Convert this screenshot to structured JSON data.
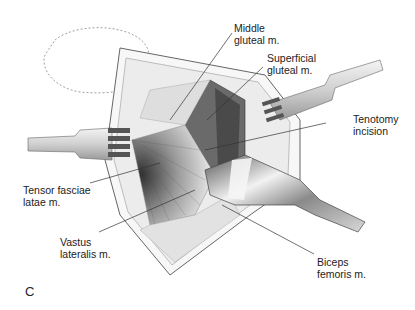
{
  "figure": {
    "panel_letter": "C",
    "labels": [
      {
        "id": "middle-gluteal",
        "lines": [
          "Middle",
          "gluteal m."
        ]
      },
      {
        "id": "superficial-gluteal",
        "lines": [
          "Superficial",
          "gluteal m."
        ]
      },
      {
        "id": "tenotomy-incision",
        "lines": [
          "Tenotomy",
          "incision"
        ]
      },
      {
        "id": "tensor-fasciae-latae",
        "lines": [
          "Tensor fasciae",
          "latae m."
        ]
      },
      {
        "id": "vastus-lateralis",
        "lines": [
          "Vastus",
          "lateralis m."
        ]
      },
      {
        "id": "biceps-femoris",
        "lines": [
          "Biceps",
          "femoris m."
        ]
      }
    ],
    "colors": {
      "line": "#333333",
      "muscle_dark": "#3a3a3a",
      "muscle_mid": "#8a8a8a",
      "tissue_light": "#e6e6e6",
      "instrument": "#bdbdbd"
    }
  }
}
